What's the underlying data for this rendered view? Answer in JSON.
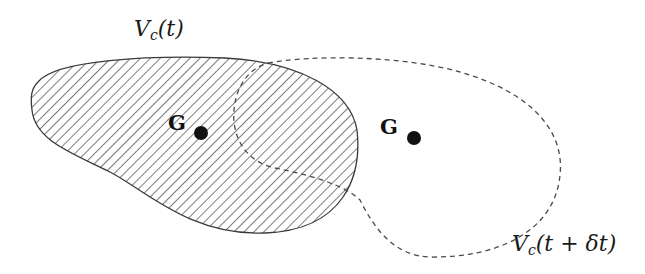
{
  "diagram": {
    "type": "control-volume-motion",
    "colors": {
      "stroke": "#3a3a3a",
      "hatch": "#5a5a5a",
      "dashed": "#4a4a4a",
      "point": "#111111",
      "background": "#ffffff"
    },
    "volume_t": {
      "label_main": "V",
      "label_sub": "c",
      "label_arg": "(t)",
      "style": "solid hatched"
    },
    "volume_t_dt": {
      "label_main": "V",
      "label_sub": "c",
      "label_arg": "(t + δt)",
      "style": "dashed outline"
    },
    "centroid_t": {
      "label": "G"
    },
    "centroid_t_dt": {
      "label": "G"
    }
  }
}
